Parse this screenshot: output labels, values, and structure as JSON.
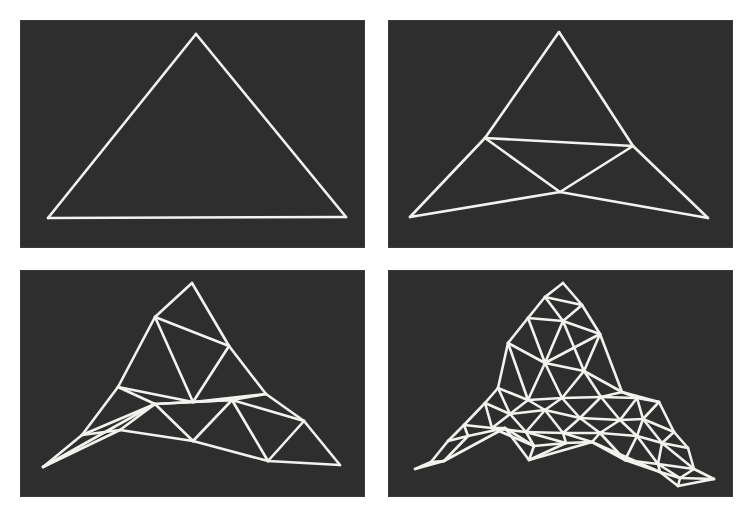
{
  "figure": {
    "background": "#ffffff",
    "panel_color": "#2e2e2e",
    "line_color": "#f2f2ee",
    "panels": [
      {
        "id": "level-0",
        "box": [
          20,
          20,
          345,
          228
        ],
        "vertices": {
          "A": [
            196,
            34
          ],
          "B": [
            48,
            218
          ],
          "C": [
            346,
            217
          ]
        },
        "edges": [
          [
            "A",
            "B"
          ],
          [
            "A",
            "C"
          ],
          [
            "B",
            "C"
          ]
        ]
      },
      {
        "id": "level-1",
        "box": [
          388,
          20,
          345,
          228
        ],
        "vertices": {
          "A": [
            559,
            32
          ],
          "B": [
            410,
            217
          ],
          "C": [
            708,
            218
          ],
          "D": [
            485,
            138
          ],
          "E": [
            633,
            146
          ],
          "F": [
            560,
            192
          ]
        },
        "edges": [
          [
            "A",
            "D"
          ],
          [
            "D",
            "B"
          ],
          [
            "A",
            "E"
          ],
          [
            "E",
            "C"
          ],
          [
            "B",
            "F"
          ],
          [
            "F",
            "C"
          ],
          [
            "D",
            "E"
          ],
          [
            "D",
            "F"
          ],
          [
            "E",
            "F"
          ]
        ]
      },
      {
        "id": "level-2",
        "box": [
          20,
          270,
          345,
          227
        ],
        "vertices": {
          "A": [
            192,
            283
          ],
          "B": [
            155,
            317
          ],
          "C": [
            229,
            346
          ],
          "D": [
            118,
            387
          ],
          "E": [
            193,
            402
          ],
          "F": [
            266,
            394
          ],
          "G": [
            82,
            435
          ],
          "H": [
            155,
            404
          ],
          "I": [
            232,
            400
          ],
          "J": [
            304,
            421
          ],
          "K": [
            43,
            467
          ],
          "L": [
            120,
            430
          ],
          "M": [
            193,
            441
          ],
          "N": [
            268,
            461
          ],
          "O": [
            340,
            465
          ]
        },
        "edges": [
          [
            "A",
            "B"
          ],
          [
            "A",
            "C"
          ],
          [
            "B",
            "C"
          ],
          [
            "B",
            "D"
          ],
          [
            "B",
            "E"
          ],
          [
            "C",
            "E"
          ],
          [
            "C",
            "F"
          ],
          [
            "E",
            "F"
          ],
          [
            "D",
            "E"
          ],
          [
            "D",
            "H"
          ],
          [
            "D",
            "G"
          ],
          [
            "H",
            "E"
          ],
          [
            "H",
            "I"
          ],
          [
            "E",
            "I"
          ],
          [
            "I",
            "F"
          ],
          [
            "F",
            "J"
          ],
          [
            "I",
            "J"
          ],
          [
            "G",
            "K"
          ],
          [
            "G",
            "H"
          ],
          [
            "G",
            "L"
          ],
          [
            "K",
            "L"
          ],
          [
            "K",
            "H"
          ],
          [
            "L",
            "H"
          ],
          [
            "L",
            "M"
          ],
          [
            "H",
            "M"
          ],
          [
            "M",
            "I"
          ],
          [
            "I",
            "N"
          ],
          [
            "M",
            "N"
          ],
          [
            "J",
            "N"
          ],
          [
            "J",
            "O"
          ],
          [
            "N",
            "O"
          ]
        ]
      },
      {
        "id": "level-3",
        "box": [
          388,
          270,
          345,
          227
        ],
        "vertices": {
          "p1": [
            563,
            283
          ],
          "p2": [
            545,
            297
          ],
          "p3": [
            582,
            305
          ],
          "p4": [
            528,
            318
          ],
          "p5": [
            563,
            321
          ],
          "p6": [
            600,
            334
          ],
          "p7": [
            508,
            343
          ],
          "p8": [
            545,
            363
          ],
          "p9": [
            584,
            371
          ],
          "p10": [
            622,
            392
          ],
          "p11": [
            498,
            388
          ],
          "p12": [
            528,
            400
          ],
          "p13": [
            562,
            398
          ],
          "p14": [
            601,
            397
          ],
          "p15": [
            637,
            398
          ],
          "p16": [
            659,
            402
          ],
          "p17": [
            485,
            403
          ],
          "p18": [
            510,
            414
          ],
          "p19": [
            545,
            410
          ],
          "p20": [
            580,
            418
          ],
          "p21": [
            620,
            420
          ],
          "p22": [
            643,
            419
          ],
          "p23": [
            674,
            432
          ],
          "p24": [
            464,
            425
          ],
          "p25": [
            492,
            428
          ],
          "p26": [
            526,
            432
          ],
          "p27": [
            563,
            433
          ],
          "p28": [
            600,
            433
          ],
          "p29": [
            637,
            436
          ],
          "p30": [
            662,
            443
          ],
          "p31": [
            688,
            448
          ],
          "p32": [
            448,
            441
          ],
          "p33": [
            468,
            436
          ],
          "p34": [
            505,
            428
          ],
          "p35": [
            534,
            446
          ],
          "p36": [
            566,
            443
          ],
          "p37": [
            592,
            442
          ],
          "p38": [
            625,
            460
          ],
          "p39": [
            658,
            464
          ],
          "p40": [
            694,
            469
          ],
          "p41": [
            431,
            462
          ],
          "p42": [
            529,
            460
          ],
          "p43": [
            660,
            472
          ],
          "p44": [
            680,
            478
          ],
          "p45": [
            714,
            479
          ],
          "p46": [
            415,
            469
          ],
          "p47": [
            444,
            461
          ],
          "p48": [
            678,
            486
          ]
        },
        "edges": [
          [
            "p1",
            "p2"
          ],
          [
            "p1",
            "p3"
          ],
          [
            "p2",
            "p3"
          ],
          [
            "p2",
            "p4"
          ],
          [
            "p2",
            "p5"
          ],
          [
            "p3",
            "p5"
          ],
          [
            "p3",
            "p6"
          ],
          [
            "p5",
            "p6"
          ],
          [
            "p4",
            "p5"
          ],
          [
            "p4",
            "p7"
          ],
          [
            "p7",
            "p8"
          ],
          [
            "p5",
            "p8"
          ],
          [
            "p4",
            "p8"
          ],
          [
            "p6",
            "p8"
          ],
          [
            "p6",
            "p9"
          ],
          [
            "p8",
            "p9"
          ],
          [
            "p5",
            "p9"
          ],
          [
            "p6",
            "p10"
          ],
          [
            "p9",
            "p10"
          ],
          [
            "p7",
            "p11"
          ],
          [
            "p8",
            "p12"
          ],
          [
            "p7",
            "p12"
          ],
          [
            "p11",
            "p12"
          ],
          [
            "p12",
            "p13"
          ],
          [
            "p8",
            "p13"
          ],
          [
            "p13",
            "p9"
          ],
          [
            "p9",
            "p14"
          ],
          [
            "p13",
            "p14"
          ],
          [
            "p14",
            "p10"
          ],
          [
            "p10",
            "p15"
          ],
          [
            "p14",
            "p15"
          ],
          [
            "p15",
            "p16"
          ],
          [
            "p10",
            "p16"
          ],
          [
            "p11",
            "p17"
          ],
          [
            "p17",
            "p18"
          ],
          [
            "p12",
            "p18"
          ],
          [
            "p11",
            "p18"
          ],
          [
            "p18",
            "p19"
          ],
          [
            "p12",
            "p19"
          ],
          [
            "p13",
            "p19"
          ],
          [
            "p19",
            "p20"
          ],
          [
            "p13",
            "p20"
          ],
          [
            "p14",
            "p20"
          ],
          [
            "p20",
            "p21"
          ],
          [
            "p14",
            "p21"
          ],
          [
            "p15",
            "p21"
          ],
          [
            "p21",
            "p22"
          ],
          [
            "p15",
            "p22"
          ],
          [
            "p16",
            "p22"
          ],
          [
            "p16",
            "p23"
          ],
          [
            "p22",
            "p23"
          ],
          [
            "p17",
            "p24"
          ],
          [
            "p24",
            "p25"
          ],
          [
            "p18",
            "p25"
          ],
          [
            "p17",
            "p25"
          ],
          [
            "p25",
            "p26"
          ],
          [
            "p18",
            "p26"
          ],
          [
            "p19",
            "p26"
          ],
          [
            "p26",
            "p27"
          ],
          [
            "p19",
            "p27"
          ],
          [
            "p20",
            "p27"
          ],
          [
            "p27",
            "p28"
          ],
          [
            "p20",
            "p28"
          ],
          [
            "p21",
            "p28"
          ],
          [
            "p28",
            "p29"
          ],
          [
            "p21",
            "p29"
          ],
          [
            "p22",
            "p29"
          ],
          [
            "p29",
            "p30"
          ],
          [
            "p22",
            "p30"
          ],
          [
            "p23",
            "p30"
          ],
          [
            "p30",
            "p31"
          ],
          [
            "p23",
            "p31"
          ],
          [
            "p24",
            "p32"
          ],
          [
            "p32",
            "p33"
          ],
          [
            "p24",
            "p33"
          ],
          [
            "p33",
            "p34"
          ],
          [
            "p25",
            "p34"
          ],
          [
            "p34",
            "p35"
          ],
          [
            "p26",
            "p35"
          ],
          [
            "p25",
            "p35"
          ],
          [
            "p35",
            "p36"
          ],
          [
            "p26",
            "p36"
          ],
          [
            "p27",
            "p36"
          ],
          [
            "p36",
            "p37"
          ],
          [
            "p27",
            "p37"
          ],
          [
            "p28",
            "p37"
          ],
          [
            "p37",
            "p38"
          ],
          [
            "p28",
            "p38"
          ],
          [
            "p29",
            "p38"
          ],
          [
            "p38",
            "p39"
          ],
          [
            "p29",
            "p39"
          ],
          [
            "p30",
            "p39"
          ],
          [
            "p39",
            "p40"
          ],
          [
            "p30",
            "p40"
          ],
          [
            "p31",
            "p40"
          ],
          [
            "p32",
            "p41"
          ],
          [
            "p41",
            "p46"
          ],
          [
            "p46",
            "p47"
          ],
          [
            "p47",
            "p34"
          ],
          [
            "p41",
            "p47"
          ],
          [
            "p33",
            "p47"
          ],
          [
            "p34",
            "p42"
          ],
          [
            "p35",
            "p42"
          ],
          [
            "p42",
            "p36"
          ],
          [
            "p42",
            "p37"
          ],
          [
            "p37",
            "p43"
          ],
          [
            "p38",
            "p43"
          ],
          [
            "p39",
            "p43"
          ],
          [
            "p43",
            "p44"
          ],
          [
            "p39",
            "p44"
          ],
          [
            "p40",
            "p44"
          ],
          [
            "p44",
            "p45"
          ],
          [
            "p40",
            "p45"
          ],
          [
            "p43",
            "p48"
          ],
          [
            "p44",
            "p48"
          ],
          [
            "p48",
            "p45"
          ]
        ]
      }
    ]
  }
}
